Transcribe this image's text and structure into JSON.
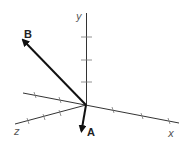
{
  "diagram": {
    "type": "3d-coordinate-axes-with-vectors",
    "colors": {
      "axis": "#333333",
      "vector": "#111111",
      "label": "#555555"
    },
    "axes": [
      {
        "name": "x",
        "label": "x"
      },
      {
        "name": "y",
        "label": "y"
      },
      {
        "name": "z",
        "label": "z"
      }
    ],
    "vectors": [
      {
        "name": "A",
        "label": "A"
      },
      {
        "name": "B",
        "label": "B"
      }
    ]
  }
}
